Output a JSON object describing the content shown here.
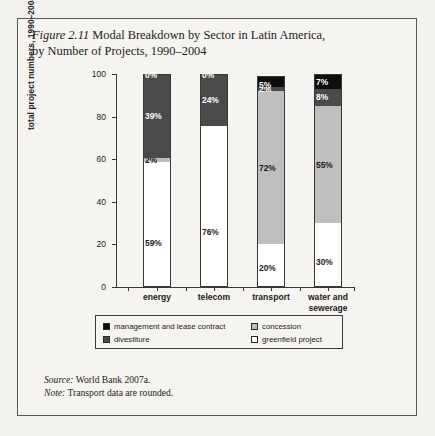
{
  "figure": {
    "number": "Figure 2.11",
    "title": "Modal Breakdown by Sector in Latin America, by Number of Projects, 1990–2004",
    "title_line1": "Modal Breakdown by Sector in Latin America,",
    "title_line2": "by Number of Projects, 1990–2004"
  },
  "notes": {
    "source_label": "Source:",
    "source_text": "World Bank 2007a.",
    "note_label": "Note:",
    "note_text": "Transport data are rounded."
  },
  "legend": {
    "entries": [
      {
        "label": "management and lease contract",
        "color": "#0d0d0d"
      },
      {
        "label": "concession",
        "color": "#bfbfbf"
      },
      {
        "label": "divestiture",
        "color": "#4a4a4a"
      },
      {
        "label": "greenfield project",
        "color": "#ffffff"
      }
    ]
  },
  "chart_data": {
    "type": "bar",
    "subtype": "100% stacked column",
    "title": "Modal Breakdown by Sector in Latin America, by Number of Projects, 1990–2004",
    "xlabel": "",
    "ylabel": "total project numbers, 1990–2004 (%)",
    "ylim": [
      0,
      100
    ],
    "yticks": [
      0,
      20,
      40,
      60,
      80,
      100
    ],
    "grid": false,
    "legend_position": "bottom",
    "categories": [
      "energy",
      "telecom",
      "transport",
      "water and sewerage"
    ],
    "category_lines": [
      [
        "energy"
      ],
      [
        "telecom"
      ],
      [
        "transport"
      ],
      [
        "water and",
        "sewerage"
      ]
    ],
    "stack_order_bottom_to_top": [
      "greenfield project",
      "concession",
      "divestiture",
      "management and lease contract"
    ],
    "series": [
      {
        "name": "greenfield project",
        "color": "#ffffff",
        "values": [
          59,
          76,
          20,
          30
        ],
        "labels": [
          "59%",
          "76%",
          "20%",
          "30%"
        ]
      },
      {
        "name": "concession",
        "color": "#bfbfbf",
        "values": [
          2,
          0,
          72,
          55
        ],
        "labels": [
          "2%",
          "0%",
          "72%",
          "55%"
        ]
      },
      {
        "name": "divestiture",
        "color": "#4a4a4a",
        "values": [
          39,
          24,
          2,
          8
        ],
        "labels": [
          "39%",
          "24%",
          "2%",
          "8%"
        ]
      },
      {
        "name": "management and lease contract",
        "color": "#0d0d0d",
        "values": [
          0,
          0,
          5,
          7
        ],
        "labels": [
          "0%",
          "0%",
          "5%",
          "7%"
        ]
      }
    ]
  }
}
